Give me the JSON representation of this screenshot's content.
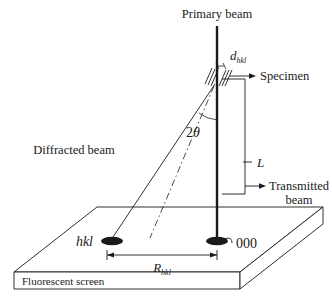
{
  "figure": {
    "name": "x-ray-diffraction-transmission-laue-geometry",
    "background_color": "#ffffff",
    "line_color": "#1a1a1a",
    "spot_color": "#1a1a1a"
  },
  "labels": {
    "primary_beam": "Primary beam",
    "specimen": "Specimen",
    "d_spacing_symbol": "d",
    "d_spacing_subscript": "hkl",
    "two_theta_number": "2",
    "two_theta_symbol": "θ",
    "diffracted_beam": "Diffracted beam",
    "distance_symbol": "L",
    "transmitted_beam_line1": "Transmitted",
    "transmitted_beam_line2": "beam",
    "hkl_spot": "hkl",
    "zero_spot": "000",
    "radius_symbol": "R",
    "radius_subscript": "hkl",
    "fluorescent_screen": "Fluorescent screen"
  },
  "geometry": {
    "primary_beam_x": 217,
    "primary_beam_top_y": 26,
    "primary_beam_bottom_y": 243,
    "specimen_y": 79,
    "screen_top_y": 207,
    "screen_spot_y": 241,
    "hkl_spot_x": 110,
    "zero_spot_x": 217,
    "two_theta_degrees": 26,
    "screen_front_left_x": 14,
    "screen_front_right_x": 240,
    "screen_back_left_x": 97,
    "screen_back_right_x": 323
  }
}
